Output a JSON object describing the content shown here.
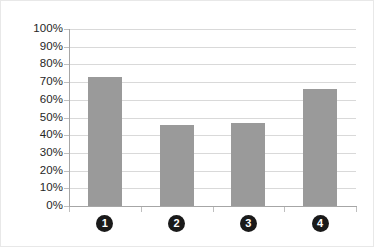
{
  "chart_data": {
    "type": "bar",
    "title": "",
    "subtitle": "",
    "xlabel": "",
    "ylabel": "",
    "categories": [
      "1",
      "2",
      "3",
      "4"
    ],
    "values": [
      73,
      46,
      47,
      66
    ],
    "value_labels": [
      "73%",
      "46%",
      "47%",
      "66%"
    ],
    "ylim": [
      0,
      100
    ],
    "ytick_labels": [
      "100%",
      "90%",
      "80%",
      "70%",
      "60%",
      "50%",
      "40%",
      "30%",
      "20%",
      "10%",
      "0%"
    ],
    "ytick_values": [
      100,
      90,
      80,
      70,
      60,
      50,
      40,
      30,
      20,
      10,
      0
    ],
    "grid": true,
    "legend": false,
    "legend_position": "none",
    "bar_color": "#9a9a9a",
    "gridline_color": "#d9d9d9",
    "axis_color": "#a6a6a6",
    "category_marker_style": "filled-circle-white-number",
    "category_marker_color": "#1a1a1a",
    "category_marker_text_color": "#ffffff"
  }
}
